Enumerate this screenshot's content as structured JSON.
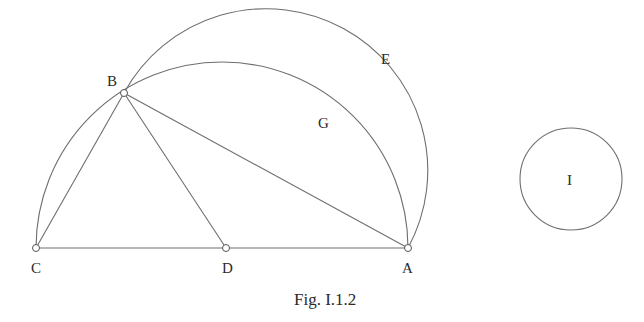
{
  "figure": {
    "caption": "Fig. I.1.2",
    "points": {
      "A": {
        "label": "A",
        "x": 408,
        "y": 248
      },
      "B": {
        "label": "B",
        "x": 124,
        "y": 93
      },
      "C": {
        "label": "C",
        "x": 36,
        "y": 248
      },
      "D": {
        "label": "D",
        "x": 226,
        "y": 248
      }
    },
    "arc_labels": {
      "E": "E",
      "G": "G"
    },
    "circle": {
      "label": "I",
      "cx": 571,
      "cy": 179,
      "r": 51
    },
    "colors": {
      "line": "#6e6e6e",
      "text": "#2a2a2a",
      "background": "#ffffff"
    }
  }
}
